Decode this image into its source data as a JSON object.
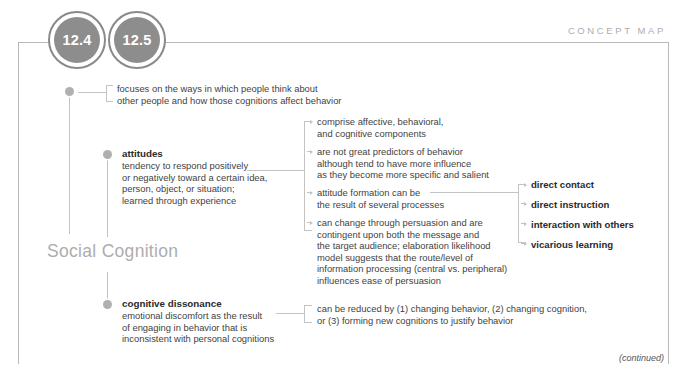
{
  "header": {
    "section_label": "CONCEPT MAP",
    "chapters": [
      "12.4",
      "12.5"
    ]
  },
  "map": {
    "title": "Social Cognition",
    "footer_note": "(continued)"
  },
  "branches": {
    "intro": {
      "text": "focuses on the ways in which people think about\nother people and how those cognitions affect behavior"
    },
    "attitudes": {
      "term": "attitudes",
      "definition": "tendency to respond positively\nor negatively toward a certain idea,\nperson, object, or situation;\nlearned through experience",
      "details": [
        "comprise affective, behavioral,\nand cognitive components",
        "are not great predictors of behavior\nalthough tend to have more influence\nas they become more specific and salient",
        "attitude formation can be\nthe result of several processes",
        "can change through persuasion and are\ncontingent upon both the message and\nthe target audience; elaboration likelihood\nmodel suggests that the route/level of\ninformation processing (central vs. peripheral)\ninfluences ease of persuasion"
      ],
      "formation_sources": [
        "direct contact",
        "direct instruction",
        "interaction with others",
        "vicarious learning"
      ]
    },
    "cognitive_dissonance": {
      "term": "cognitive dissonance",
      "definition": "emotional discomfort as the result\nof engaging in behavior that is\ninconsistent with personal cognitions",
      "details": [
        "can be reduced by (1) changing behavior, (2) changing cognition,\nor (3) forming new cognitions to justify behavior"
      ]
    }
  },
  "colors": {
    "circle_fill": "#8d8d8d",
    "circle_ring": "#8a8a8a",
    "frame": "#b9b9b9",
    "connector": "#c3c3c3",
    "node_dot": "#b0b0b0",
    "title": "#adadad",
    "text": "#3f3f3f"
  }
}
